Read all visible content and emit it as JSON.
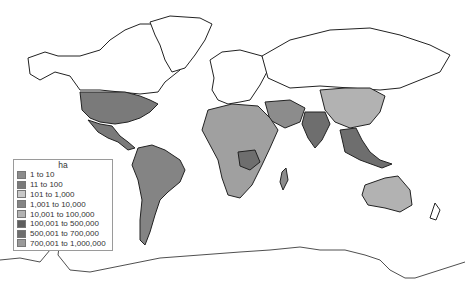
{
  "map": {
    "title": "",
    "projection": "world",
    "legend": {
      "title": "ha",
      "items": [
        {
          "label": "1 to 10",
          "color": "#8c8c8c"
        },
        {
          "label": "11 to 100",
          "color": "#7a7a7a"
        },
        {
          "label": "101 to 1,000",
          "color": "#c8c8c8"
        },
        {
          "label": "1,001 to 10,000",
          "color": "#848484"
        },
        {
          "label": "10,001 to 100,000",
          "color": "#b2b2b2"
        },
        {
          "label": "100,001 to 500,000",
          "color": "#5e5e5e"
        },
        {
          "label": "500,001 to 700,000",
          "color": "#6e6e6e"
        },
        {
          "label": "700,001 to 1,000,000",
          "color": "#9a9a9a"
        }
      ]
    },
    "regions": [
      {
        "name": "United States",
        "color": "#7a7a7a"
      },
      {
        "name": "Mexico",
        "color": "#7a7a7a"
      },
      {
        "name": "Brazil",
        "color": "#848484"
      },
      {
        "name": "Argentina",
        "color": "#7a7a7a"
      },
      {
        "name": "China",
        "color": "#b2b2b2"
      },
      {
        "name": "India",
        "color": "#6e6e6e"
      },
      {
        "name": "Australia",
        "color": "#b2b2b2"
      },
      {
        "name": "DR Congo",
        "color": "#6e6e6e"
      },
      {
        "name": "Sudan",
        "color": "#b2b2b2"
      },
      {
        "name": "Madagascar",
        "color": "#8c8c8c"
      }
    ]
  }
}
